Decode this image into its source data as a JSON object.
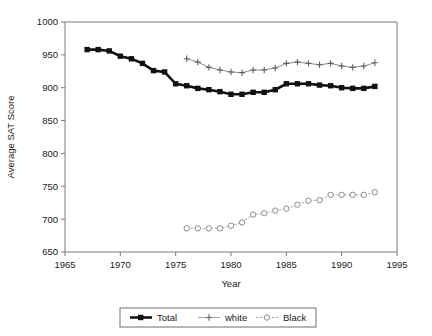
{
  "chart_data": {
    "type": "line",
    "title": "",
    "xlabel": "Year",
    "ylabel": "Average SAT Score",
    "xlim": [
      1965,
      1995
    ],
    "ylim": [
      650,
      1000
    ],
    "xticks": [
      1965,
      1970,
      1975,
      1980,
      1985,
      1990,
      1995
    ],
    "yticks": [
      650,
      700,
      750,
      800,
      850,
      900,
      950,
      1000
    ],
    "grid": false,
    "legend_position": "bottom-center",
    "series": [
      {
        "name": "Total",
        "marker": "filled-square",
        "color": "#111111",
        "x": [
          1967,
          1968,
          1969,
          1970,
          1971,
          1972,
          1973,
          1974,
          1975,
          1976,
          1977,
          1978,
          1979,
          1980,
          1981,
          1982,
          1983,
          1984,
          1985,
          1986,
          1987,
          1988,
          1989,
          1990,
          1991,
          1992,
          1993
        ],
        "values": [
          958,
          958,
          956,
          948,
          944,
          937,
          926,
          924,
          906,
          903,
          899,
          897,
          894,
          890,
          890,
          893,
          893,
          897,
          906,
          906,
          906,
          904,
          903,
          900,
          899,
          899,
          902
        ]
      },
      {
        "name": "white",
        "marker": "plus",
        "color": "#5f5f5f",
        "x": [
          1976,
          1977,
          1978,
          1979,
          1980,
          1981,
          1982,
          1983,
          1984,
          1985,
          1986,
          1987,
          1988,
          1989,
          1990,
          1991,
          1992,
          1993
        ],
        "values": [
          944,
          939,
          931,
          927,
          924,
          923,
          927,
          927,
          930,
          937,
          939,
          937,
          935,
          937,
          933,
          931,
          933,
          938
        ]
      },
      {
        "name": "Black",
        "marker": "open-circle",
        "color": "#8a8a8a",
        "x": [
          1976,
          1977,
          1978,
          1979,
          1980,
          1981,
          1982,
          1983,
          1984,
          1985,
          1986,
          1987,
          1988,
          1989,
          1990,
          1991,
          1992,
          1993
        ],
        "values": [
          686,
          686,
          686,
          686,
          690,
          695,
          707,
          709,
          713,
          716,
          722,
          728,
          729,
          737,
          737,
          737,
          737,
          741
        ]
      }
    ]
  },
  "legend": {
    "items": [
      {
        "label": "Total"
      },
      {
        "label": "white"
      },
      {
        "label": "Black"
      }
    ]
  }
}
